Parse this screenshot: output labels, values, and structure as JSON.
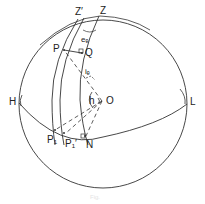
{
  "figure": {
    "labels": {
      "Z": "Z",
      "Z_prime": "Z′",
      "P": "P",
      "Q": "Q",
      "e_c": "eₑ",
      "i_c": "iₑ",
      "h": "h",
      "O": "O",
      "H": "H",
      "L": "L",
      "P1": "P₁",
      "P1_prime": "P₁′",
      "N": "N"
    },
    "caption": "Fig."
  },
  "colors": {
    "line": "#333333",
    "background": "#ffffff"
  }
}
